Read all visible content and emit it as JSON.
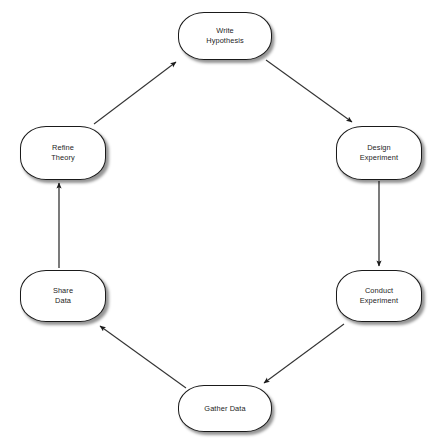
{
  "diagram": {
    "type": "cycle-flowchart",
    "background_color": "#ffffff",
    "node_fill_color": "#ffffff",
    "node_border_color": "#1a1a1a",
    "edge_color": "#333333",
    "text_color": "#1c1c1c",
    "nodes": [
      {
        "id": "write-hypothesis",
        "label": "Write\nHypothesis",
        "x": 178,
        "y": 12,
        "width": 94,
        "height": 48
      },
      {
        "id": "design-experiment",
        "label": "Design\nExperiment",
        "x": 336,
        "y": 126,
        "width": 86,
        "height": 54
      },
      {
        "id": "conduct-experiment",
        "label": "Conduct\nExperiment",
        "x": 336,
        "y": 270,
        "width": 86,
        "height": 52
      },
      {
        "id": "gather-data",
        "label": "Gather Data",
        "x": 178,
        "y": 385,
        "width": 94,
        "height": 47
      },
      {
        "id": "share-data",
        "label": "Share\nData",
        "x": 20,
        "y": 270,
        "width": 86,
        "height": 52
      },
      {
        "id": "refine-theory",
        "label": "Refine\nTheory",
        "x": 20,
        "y": 126,
        "width": 86,
        "height": 54
      }
    ],
    "edges": [
      {
        "id": "edge-write-hypothesis-to-design-experiment",
        "from": "write-hypothesis",
        "to": "design-experiment",
        "direction": "down-right",
        "x1": 266,
        "y1": 60,
        "x2": 352,
        "y2": 122
      },
      {
        "id": "edge-design-experiment-to-conduct-experiment",
        "from": "design-experiment",
        "to": "conduct-experiment",
        "direction": "down",
        "x1": 379,
        "y1": 181,
        "x2": 379,
        "y2": 266
      },
      {
        "id": "edge-conduct-experiment-to-gather-data",
        "from": "conduct-experiment",
        "to": "gather-data",
        "direction": "down-left",
        "x1": 344,
        "y1": 324,
        "x2": 264,
        "y2": 383
      },
      {
        "id": "edge-gather-data-to-share-data",
        "from": "gather-data",
        "to": "share-data",
        "direction": "up-left",
        "x1": 186,
        "y1": 388,
        "x2": 100,
        "y2": 326
      },
      {
        "id": "edge-share-data-to-refine-theory",
        "from": "share-data",
        "to": "refine-theory",
        "direction": "up",
        "x1": 59,
        "y1": 268,
        "x2": 59,
        "y2": 183
      },
      {
        "id": "edge-refine-theory-to-write-hypothesis",
        "from": "refine-theory",
        "to": "write-hypothesis",
        "direction": "up-right",
        "x1": 94,
        "y1": 124,
        "x2": 176,
        "y2": 62
      }
    ]
  }
}
